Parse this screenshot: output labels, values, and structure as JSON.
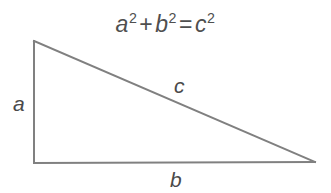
{
  "figure": {
    "background_color": "#ffffff",
    "stroke_color": "#808080",
    "text_color": "#4f4f4f",
    "width": 331,
    "height": 193
  },
  "equation": {
    "full_text": "a2 + b2 = c2",
    "terms": {
      "a_base": "a",
      "a_exponent": "2",
      "plus": "+",
      "b_base": "b",
      "b_exponent": "2",
      "equals": "=",
      "c_base": "c",
      "c_exponent": "2"
    }
  },
  "labels": {
    "leg_vertical": "a",
    "leg_horizontal": "b",
    "hypotenuse": "c"
  },
  "geometry": {
    "vertices": {
      "top_left": [
        34,
        41
      ],
      "bottom_left": [
        34,
        163
      ],
      "bottom_right": [
        315,
        162
      ]
    },
    "stroke_width": 2
  }
}
